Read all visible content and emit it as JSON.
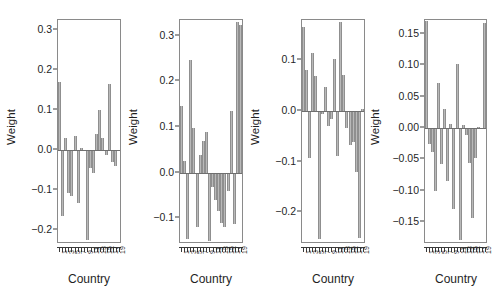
{
  "figure": {
    "panel_count": 4,
    "xlabel": "Country",
    "ylabel": "Weight"
  },
  "chart_data": [
    {
      "type": "bar",
      "title": "",
      "xlabel": "Country",
      "ylabel": "Weight",
      "categories": [
        "1",
        "2",
        "3",
        "4",
        "5",
        "6",
        "7",
        "8",
        "9",
        "10",
        "11",
        "12",
        "13",
        "14",
        "15",
        "16",
        "17",
        "18",
        "19",
        "20"
      ],
      "tick_labels": [
        "1",
        "3",
        "5",
        "7",
        "9",
        "11",
        "13",
        "15",
        "17",
        "19"
      ],
      "values": [
        0.171,
        -0.166,
        0.031,
        -0.107,
        -0.115,
        0.035,
        -0.133,
        0.006,
        -0.002,
        -0.225,
        -0.044,
        -0.058,
        0.04,
        0.1,
        0.03,
        -0.012,
        0.166,
        -0.031,
        -0.04,
        -0.001
      ],
      "yticks": [
        0.3,
        0.2,
        0.1,
        0.0,
        -0.1,
        -0.2
      ],
      "ytick_labels": [
        "0.3",
        "0.2",
        "0.1",
        "0.0",
        "-0.1",
        "-0.2"
      ],
      "ylim": [
        -0.235,
        0.325
      ],
      "grid": false,
      "legend": "none"
    },
    {
      "type": "bar",
      "title": "",
      "xlabel": "Country",
      "ylabel": "Weight",
      "categories": [
        "1",
        "2",
        "3",
        "4",
        "5",
        "6",
        "7",
        "8",
        "9",
        "10",
        "11",
        "12",
        "13",
        "14",
        "15",
        "16",
        "17",
        "18",
        "19",
        "20"
      ],
      "tick_labels": [
        "1",
        "3",
        "5",
        "7",
        "9",
        "11",
        "13",
        "15",
        "17",
        "19"
      ],
      "values": [
        0.146,
        0.026,
        -0.145,
        0.248,
        0.097,
        -0.12,
        0.038,
        0.07,
        0.09,
        -0.15,
        -0.032,
        -0.06,
        -0.085,
        -0.11,
        -0.12,
        -0.04,
        0.136,
        -0.113,
        0.33,
        0.325
      ],
      "yticks": [
        0.3,
        0.2,
        0.1,
        0.0,
        -0.1
      ],
      "ytick_labels": [
        "0.3",
        "0.2",
        "0.1",
        "0.0",
        "-0.1"
      ],
      "ylim": [
        -0.157,
        0.335
      ],
      "grid": false,
      "legend": "none"
    },
    {
      "type": "bar",
      "title": "",
      "xlabel": "Country",
      "ylabel": "Weight",
      "categories": [
        "1",
        "2",
        "3",
        "4",
        "5",
        "6",
        "7",
        "8",
        "9",
        "10",
        "11",
        "12",
        "13",
        "14",
        "15",
        "16",
        "17",
        "18",
        "19",
        "20"
      ],
      "tick_labels": [
        "1",
        "3",
        "5",
        "7",
        "9",
        "11",
        "13",
        "15",
        "17",
        "19"
      ],
      "values": [
        0.165,
        0.08,
        -0.094,
        0.113,
        0.068,
        -0.253,
        -0.006,
        0.046,
        -0.03,
        -0.017,
        0.102,
        -0.09,
        0.175,
        0.07,
        -0.035,
        -0.068,
        -0.062,
        -0.12,
        -0.25,
        0.004
      ],
      "yticks": [
        0.1,
        0.0,
        -0.1,
        -0.2
      ],
      "ytick_labels": [
        "0.1",
        "0.0",
        "-0.1",
        "-0.2"
      ],
      "ylim": [
        -0.262,
        0.178
      ],
      "grid": false,
      "legend": "none"
    },
    {
      "type": "bar",
      "title": "",
      "xlabel": "Country",
      "ylabel": "Weight",
      "categories": [
        "1",
        "2",
        "3",
        "4",
        "5",
        "6",
        "7",
        "8",
        "9",
        "10",
        "11",
        "12",
        "13",
        "14",
        "15",
        "16",
        "17",
        "18",
        "19",
        "20"
      ],
      "tick_labels": [
        "1",
        "3",
        "5",
        "7",
        "9",
        "11",
        "13",
        "15",
        "17",
        "19"
      ],
      "values": [
        0.17,
        -0.026,
        -0.038,
        -0.101,
        0.071,
        -0.057,
        0.03,
        -0.085,
        0.006,
        -0.13,
        0.102,
        -0.178,
        0.004,
        -0.012,
        -0.056,
        -0.143,
        -0.048,
        0.002,
        -0.001,
        0.168
      ],
      "yticks": [
        0.15,
        0.1,
        0.05,
        0.0,
        -0.05,
        -0.1,
        -0.15
      ],
      "ytick_labels": [
        "0.15",
        "0.10",
        "0.05",
        "0.00",
        "-0.05",
        "-0.10",
        "-0.15"
      ],
      "ylim": [
        -0.185,
        0.172
      ],
      "grid": false,
      "legend": "none"
    }
  ],
  "colors": {
    "bar_fill": "#b9b9b9",
    "bar_edge": "#8f8f8f",
    "axis": "#3a3a3a",
    "frame": "#8a8a8a",
    "background": "#ffffff"
  }
}
